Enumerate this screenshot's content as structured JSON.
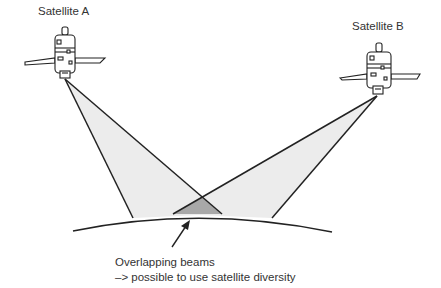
{
  "diagram": {
    "satellites": [
      {
        "name": "Satellite A",
        "label_x": 38,
        "label_y": 13
      },
      {
        "name": "Satellite B",
        "label_x": 352,
        "label_y": 28
      }
    ],
    "caption": {
      "line1": "Overlapping beams",
      "line2": "–> possible to use satellite diversity"
    },
    "colors": {
      "beam_fill": "#ececec",
      "overlap_fill": "#a8a8a8",
      "stroke": "#222222",
      "text": "#333333"
    }
  }
}
